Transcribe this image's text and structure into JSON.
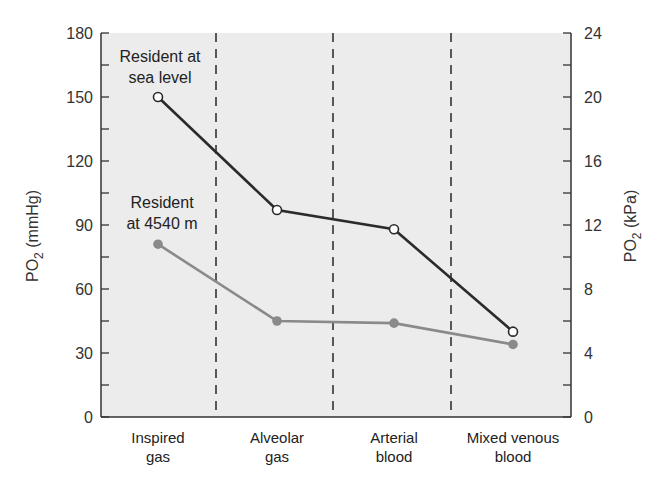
{
  "chart_data": {
    "type": "line",
    "title": "",
    "categories": [
      "Inspired gas",
      "Alveolar gas",
      "Arterial blood",
      "Mixed venous blood"
    ],
    "category_lines": [
      [
        "Inspired",
        "gas"
      ],
      [
        "Alveolar",
        "gas"
      ],
      [
        "Arterial",
        "blood"
      ],
      [
        "Mixed venous",
        "blood"
      ]
    ],
    "series": [
      {
        "name": "Resident at sea level",
        "label_lines": [
          "Resident at",
          "sea level"
        ],
        "values": [
          150,
          97,
          88,
          40
        ],
        "color": "#2b2b2b",
        "marker": "open-circle"
      },
      {
        "name": "Resident at 4540 m",
        "label_lines": [
          "Resident",
          "at 4540 m"
        ],
        "values": [
          81,
          45,
          44,
          34
        ],
        "color": "#8a8a8a",
        "marker": "filled-circle"
      }
    ],
    "ylabel": "PO2 (mmHg)",
    "ylabel_right": "PO2 (kPa)",
    "ylim": [
      0,
      180
    ],
    "yticks": [
      0,
      30,
      60,
      90,
      120,
      150,
      180
    ],
    "ylim_right": [
      0,
      24
    ],
    "yticks_right": [
      0,
      4,
      8,
      12,
      16,
      20,
      24
    ],
    "grid": false,
    "separators": "dashed vertical lines between categories",
    "background": "#ececec"
  },
  "labels": {
    "ylabel_main": "PO",
    "ylabel_sub": "2",
    "ylabel_unit_left": " (mmHg)",
    "ylabel_unit_right": " (kPa)"
  }
}
